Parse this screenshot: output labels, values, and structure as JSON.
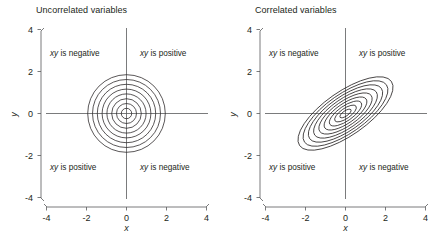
{
  "figure": {
    "background": "#ffffff",
    "ink_color": "#231f20",
    "panel_count": 2
  },
  "panels": [
    {
      "id": "uncorrelated",
      "title": "Uncorrelated variables",
      "xlabel": "x",
      "ylabel": "y",
      "xticks": [
        "-4",
        "-2",
        "0",
        "2",
        "4"
      ],
      "yticks": [
        "4",
        "2",
        "0",
        "-2",
        "-4"
      ],
      "quadrants": {
        "top_left": "xy is negative",
        "top_right": "xy is positive",
        "bottom_left": "xy is positive",
        "bottom_right": "xy is negative"
      }
    },
    {
      "id": "correlated",
      "title": "Correlated variables",
      "xlabel": "x",
      "ylabel": "y",
      "xticks": [
        "-4",
        "-2",
        "0",
        "2",
        "4"
      ],
      "yticks": [
        "4",
        "2",
        "0",
        "-2",
        "-4"
      ],
      "quadrants": {
        "top_left": "xy is negative",
        "top_right": "xy is positive",
        "bottom_left": "xy is positive",
        "bottom_right": "xy is negative"
      }
    }
  ],
  "chart_data": [
    {
      "type": "line",
      "subtype": "contour",
      "title": "Uncorrelated variables",
      "xlabel": "x",
      "ylabel": "y",
      "xlim": [
        -4,
        4
      ],
      "ylim": [
        -4,
        4
      ],
      "xticks": [
        -4,
        -2,
        0,
        2,
        4
      ],
      "yticks": [
        -4,
        -2,
        0,
        2,
        4
      ],
      "grid": false,
      "legend": "none",
      "center": [
        0,
        0
      ],
      "correlation": 0.0,
      "contour_shape": "circle",
      "contour_rotation_deg": 0,
      "contour_radii": [
        0.26,
        0.5,
        0.74,
        0.98,
        1.22,
        1.46,
        1.7,
        1.94
      ],
      "contour_count": 8,
      "annotations": [
        {
          "text": "xy is negative",
          "x": -2.2,
          "y": 2.55
        },
        {
          "text": "xy is positive",
          "x": 1.95,
          "y": 2.55
        },
        {
          "text": "xy is positive",
          "x": -2.2,
          "y": -2.5
        },
        {
          "text": "xy is negative",
          "x": 1.95,
          "y": -2.5
        }
      ]
    },
    {
      "type": "line",
      "subtype": "contour",
      "title": "Correlated variables",
      "xlabel": "x",
      "ylabel": "y",
      "xlim": [
        -4,
        4
      ],
      "ylim": [
        -4,
        4
      ],
      "xticks": [
        -4,
        -2,
        0,
        2,
        4
      ],
      "yticks": [
        -4,
        -2,
        0,
        2,
        4
      ],
      "grid": false,
      "legend": "none",
      "center": [
        0,
        0
      ],
      "correlation": 0.8,
      "contour_shape": "ellipse",
      "contour_rotation_deg": 35,
      "contour_semi_major": [
        0.33,
        0.64,
        0.95,
        1.26,
        1.57,
        1.88,
        2.19,
        2.5,
        2.8
      ],
      "contour_semi_minor": [
        0.13,
        0.25,
        0.37,
        0.49,
        0.61,
        0.73,
        0.85,
        0.97,
        1.09
      ],
      "contour_count": 9,
      "annotations": [
        {
          "text": "xy is negative",
          "x": -2.2,
          "y": 2.55
        },
        {
          "text": "xy is positive",
          "x": 1.95,
          "y": 2.55
        },
        {
          "text": "xy is positive",
          "x": -2.2,
          "y": -2.5
        },
        {
          "text": "xy is negative",
          "x": 1.95,
          "y": -2.5
        }
      ]
    }
  ]
}
